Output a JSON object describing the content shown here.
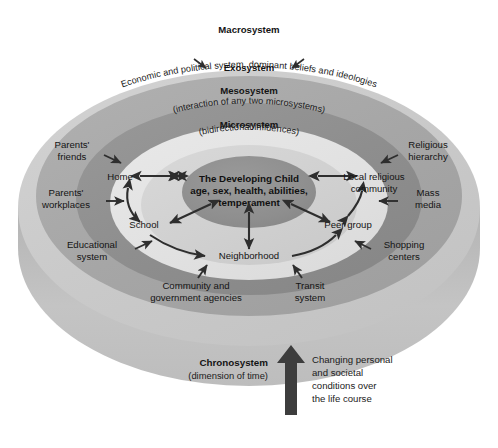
{
  "figure": {
    "type": "ecological-systems-model",
    "title_center": [
      "The Developing Child",
      "age, sex, health, abilities,",
      "temperament"
    ],
    "background_color": "#ffffff"
  },
  "rings": [
    {
      "id": "macrosystem",
      "title": "Macrosystem",
      "subtitle": "Economic and political system, dominant beliefs and ideologies",
      "color": "#a8a8a8"
    },
    {
      "id": "exosystem",
      "title": "Exosystem",
      "subtitle": "",
      "color": "#8e8e8e"
    },
    {
      "id": "mesosystem",
      "title": "Mesosystem",
      "subtitle": "(interaction of any two microsystems)",
      "color": "#e3e3e3"
    },
    {
      "id": "microsystem",
      "title": "Microsystem",
      "subtitle": "(bidirectional influences)",
      "color": "#d2d2d2"
    }
  ],
  "outer_disc": {
    "top_color": "#c9c9c9",
    "side_color": "#b9b9b9",
    "bottom_color": "#d8d8d8"
  },
  "center": {
    "color": "#8e8e8e",
    "lines": [
      "The Developing Child",
      "age, sex, health, abilities,",
      "temperament"
    ]
  },
  "microsystem_nodes": [
    {
      "id": "home",
      "label": "Home"
    },
    {
      "id": "school",
      "label": "School"
    },
    {
      "id": "neighborhood",
      "label": "Neighborhood"
    },
    {
      "id": "peer-group",
      "label": "Peer group"
    },
    {
      "id": "local-religious-community",
      "label": "Local religious\ncommunity",
      "lines": [
        "Local religious",
        "community"
      ]
    }
  ],
  "exosystem_nodes": [
    {
      "id": "parents-friends",
      "label": "Parents' friends",
      "lines": [
        "Parents'",
        "friends"
      ]
    },
    {
      "id": "parents-workplaces",
      "label": "Parents' workplaces",
      "lines": [
        "Parents'",
        "workplaces"
      ]
    },
    {
      "id": "educational-system",
      "label": "Educational system",
      "lines": [
        "Educational",
        "system"
      ]
    },
    {
      "id": "community-and-government-agencies",
      "label": "Community and government agencies",
      "lines": [
        "Community and",
        "government agencies"
      ]
    },
    {
      "id": "transit-system",
      "label": "Transit system",
      "lines": [
        "Transit",
        "system"
      ]
    },
    {
      "id": "shopping-centers",
      "label": "Shopping centers",
      "lines": [
        "Shopping",
        "centers"
      ]
    },
    {
      "id": "mass-media",
      "label": "Mass media",
      "lines": [
        "Mass",
        "media"
      ]
    },
    {
      "id": "religious-hierarchy",
      "label": "Religious hierarchy",
      "lines": [
        "Religious",
        "hierarchy"
      ]
    }
  ],
  "chronosystem": {
    "title": "Chronosystem",
    "subtitle": "(dimension of time)",
    "note_lines": [
      "Changing personal",
      "and societal",
      "conditions over",
      "the life course"
    ],
    "arrow_color": "#3d3d3d",
    "arrow_direction": "up"
  },
  "arrows": {
    "color": "#2e2e2e",
    "bidirectional_pairs": [
      [
        "The Developing Child",
        "Home"
      ],
      [
        "The Developing Child",
        "School"
      ],
      [
        "The Developing Child",
        "Neighborhood"
      ],
      [
        "The Developing Child",
        "Peer group"
      ],
      [
        "The Developing Child",
        "Local religious community"
      ]
    ],
    "microsystem_links": [
      [
        "Home",
        "School"
      ],
      [
        "School",
        "Neighborhood"
      ],
      [
        "Neighborhood",
        "Peer group"
      ],
      [
        "Peer group",
        "Local religious community"
      ]
    ],
    "exosystem_inward": [
      [
        "Parents' friends",
        "Home"
      ],
      [
        "Parents' workplaces",
        "Home"
      ],
      [
        "Educational system",
        "School"
      ],
      [
        "Community and government agencies",
        "Neighborhood"
      ],
      [
        "Transit system",
        "Neighborhood"
      ],
      [
        "Shopping centers",
        "Peer group"
      ],
      [
        "Mass media",
        "Local religious community"
      ],
      [
        "Religious hierarchy",
        "Local religious community"
      ]
    ],
    "macro_to_exo_count": 2
  }
}
